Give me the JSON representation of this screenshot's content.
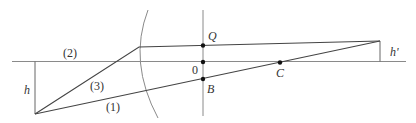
{
  "diagram": {
    "type": "optics-ray-diagram",
    "colors": {
      "ray": "#444444",
      "axis": "#8a8a8a",
      "surface": "#8a8a8a",
      "point": "#111111",
      "text": "#333333"
    },
    "labels": {
      "ray1": "(1)",
      "ray2": "(2)",
      "ray3": "(3)",
      "object_height": "h",
      "image_height": "h'",
      "point_Q": "Q",
      "point_O": "0",
      "point_B": "B",
      "point_C": "C"
    },
    "elements": {
      "optical_axis": "horizontal axis line",
      "refracting_surface": "spherical surface (arc)",
      "vertex_plane": "vertical line through Q, 0, B",
      "object": "vertical segment of height h below axis",
      "image": "vertical segment of height h' above axis"
    }
  }
}
